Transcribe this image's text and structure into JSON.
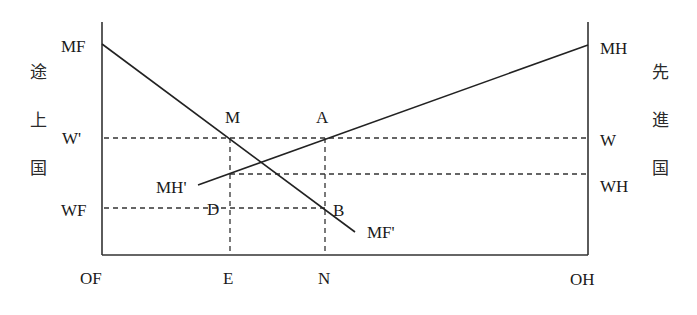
{
  "diagram": {
    "left_side_label": [
      "途",
      "上",
      "国"
    ],
    "right_side_label": [
      "先",
      "進",
      "国"
    ],
    "axis_labels": {
      "left_origin": "OF",
      "right_origin": "OH",
      "e": "E",
      "n": "N"
    },
    "left_axis_labels": {
      "mf": "MF",
      "w_prime": "W'",
      "wf": "WF"
    },
    "right_axis_labels": {
      "mh": "MH",
      "w": "W",
      "wh": "WH"
    },
    "curve_labels": {
      "mf_prime": "MF'",
      "mh_prime": "MH'"
    },
    "point_labels": {
      "m": "M",
      "a": "A",
      "d": "D",
      "b": "B"
    },
    "geometry": {
      "left_axis_x": 102,
      "right_axis_x": 588,
      "axis_top_y": 22,
      "axis_bottom_y": 255,
      "mf_curve": {
        "from": [
          102,
          44
        ],
        "to": [
          355,
          232
        ]
      },
      "mh_curve": {
        "from": [
          198,
          185
        ],
        "to": [
          588,
          45
        ]
      },
      "w_prime_y": 138,
      "wh_y": 174,
      "wf_y": 208,
      "e_x": 230,
      "n_x": 325
    }
  }
}
